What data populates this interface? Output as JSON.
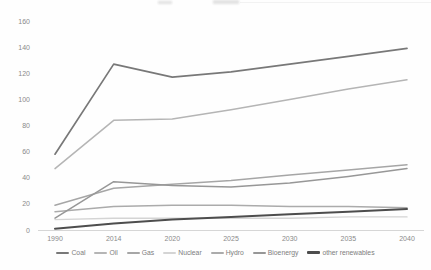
{
  "figure": {
    "background": "#fefefe",
    "text_color": "#8a8a8a",
    "axis_line_color": "#d6d6d6"
  },
  "chart_data": {
    "type": "line",
    "title": "",
    "xlabel": "",
    "ylabel": "",
    "categories": [
      "1990",
      "2014",
      "2020",
      "2025",
      "2030",
      "2035",
      "2040"
    ],
    "series": [
      {
        "name": "Coal",
        "color": "#787878",
        "width": 1.7,
        "values": [
          58,
          127,
          117,
          121,
          127,
          133,
          139
        ]
      },
      {
        "name": "Oil",
        "color": "#b5b5b5",
        "width": 1.5,
        "values": [
          47,
          84,
          85,
          92,
          100,
          108,
          115
        ]
      },
      {
        "name": "Gas",
        "color": "#a6a6a6",
        "width": 1.5,
        "values": [
          19,
          32,
          35,
          38,
          42,
          46,
          50
        ]
      },
      {
        "name": "Nuclear",
        "color": "#d4d4d4",
        "width": 1.4,
        "values": [
          8,
          9,
          9,
          9,
          9,
          10,
          10
        ]
      },
      {
        "name": "Hydro",
        "color": "#ababab",
        "width": 1.5,
        "values": [
          14,
          18,
          19,
          19,
          18,
          18,
          17
        ]
      },
      {
        "name": "Bioenergy",
        "color": "#979797",
        "width": 1.5,
        "values": [
          9,
          37,
          34,
          33,
          36,
          41,
          47
        ]
      },
      {
        "name": "other renewables",
        "color": "#4d4d4d",
        "width": 2.0,
        "values": [
          1,
          5,
          8,
          10,
          12,
          14,
          16
        ]
      }
    ],
    "ylim": [
      0,
      160
    ],
    "y_ticks": [
      0,
      20,
      40,
      60,
      80,
      100,
      120,
      140,
      160
    ],
    "grid": false,
    "legend_position": "bottom"
  }
}
